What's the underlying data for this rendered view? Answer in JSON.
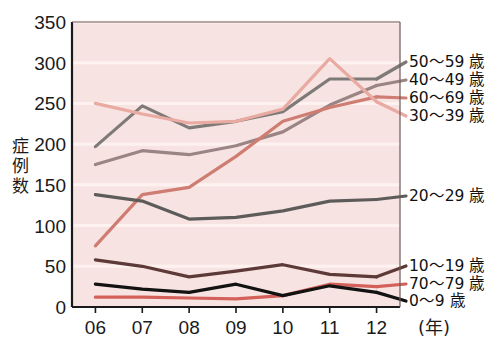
{
  "chart_data": {
    "type": "line",
    "title": "",
    "xlabel": "年",
    "ylabel": "症例数",
    "x": [
      "06",
      "07",
      "08",
      "09",
      "10",
      "11",
      "12"
    ],
    "xtick_labels": [
      "06",
      "07",
      "08",
      "09",
      "10",
      "11",
      "12"
    ],
    "x_unit_label": "(年)",
    "ytick_labels": [
      "0",
      "50",
      "100",
      "150",
      "200",
      "250",
      "300",
      "350"
    ],
    "ytick_values": [
      0,
      50,
      100,
      150,
      200,
      250,
      300,
      350
    ],
    "ylim": [
      0,
      350
    ],
    "grid": true,
    "grid_axis": "y",
    "legend_position": "right-inline",
    "plot_background": "#f7e4e2",
    "series": [
      {
        "name": "50～59 歳",
        "label": "50～59 歳",
        "color": "#7d7a78",
        "values": [
          197,
          247,
          220,
          228,
          240,
          280,
          280
        ]
      },
      {
        "name": "40～49 歳",
        "label": "40～49 歳",
        "color": "#9b8584",
        "values": [
          175,
          192,
          187,
          198,
          215,
          248,
          272
        ]
      },
      {
        "name": "60～69 歳",
        "label": "60～69 歳",
        "color": "#cf7d72",
        "values": [
          75,
          138,
          147,
          185,
          228,
          245,
          258
        ]
      },
      {
        "name": "30～39 歳",
        "label": "30～39 歳",
        "color": "#e8aaa1",
        "values": [
          250,
          237,
          226,
          228,
          243,
          305,
          252
        ]
      },
      {
        "name": "20～29 歳",
        "label": "20～29 歳",
        "color": "#5e5c5b",
        "values": [
          138,
          130,
          108,
          110,
          118,
          130,
          132
        ]
      },
      {
        "name": "10～19 歳",
        "label": "10～19 歳",
        "color": "#5d3a38",
        "values": [
          58,
          50,
          37,
          44,
          52,
          40,
          37
        ]
      },
      {
        "name": "70～79 歳",
        "label": "70～79 歳",
        "color": "#d4605a",
        "values": [
          12,
          12,
          11,
          10,
          14,
          28,
          25
        ]
      },
      {
        "name": "0～9 歳",
        "label": "0～9 歳",
        "color": "#121212",
        "values": [
          28,
          22,
          18,
          28,
          14,
          26,
          18
        ]
      }
    ],
    "legend_entries": [
      {
        "label": "50～59 歳",
        "color": "#7d7a78"
      },
      {
        "label": "40～49 歳",
        "color": "#9b8584"
      },
      {
        "label": "60～69 歳",
        "color": "#cf7d72"
      },
      {
        "label": "30～39 歳",
        "color": "#e8aaa1"
      },
      {
        "label": "20～29 歳",
        "color": "#5e5c5b"
      },
      {
        "label": "10～19 歳",
        "color": "#5d3a38"
      },
      {
        "label": "70～79 歳",
        "color": "#d4605a"
      },
      {
        "label": "0～9 歳",
        "color": "#121212"
      }
    ]
  },
  "legend": {
    "top_group": [
      "50～59 歳",
      "40～49 歳",
      "60～69 歳",
      "30～39 歳"
    ],
    "mid_group": [
      "20～29 歳"
    ],
    "bottom_group": [
      "10～19 歳",
      "70～79 歳",
      "0～9 歳"
    ]
  },
  "axes": {
    "y_title_chars": [
      "症",
      "例",
      "数"
    ],
    "y_labels": [
      "350",
      "300",
      "250",
      "200",
      "150",
      "100",
      "50",
      "0"
    ],
    "x_labels": [
      "06",
      "07",
      "08",
      "09",
      "10",
      "11",
      "12"
    ],
    "x_unit": "(年)"
  },
  "colors": {
    "plot_bg": "#f7e4e2",
    "axis": "#1a1a1a",
    "gridline": "#fdf2f0",
    "page_bg": "#ffffff"
  }
}
